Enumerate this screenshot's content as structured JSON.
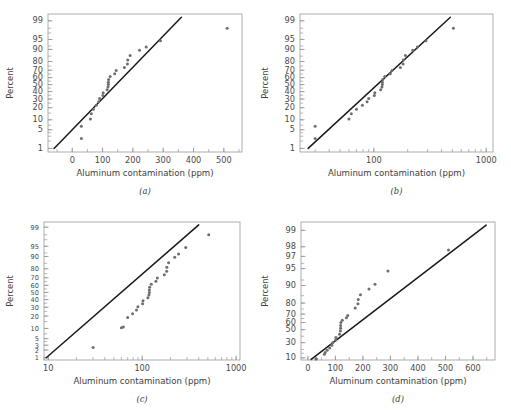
{
  "figure": {
    "background": "#ffffff",
    "point_color": "#6e6e6e",
    "line_color": "#1a1a1a",
    "axis_color": "#9a9a9a",
    "text_color": "#444444"
  },
  "panels": [
    {
      "id": "a",
      "caption": "(a)",
      "xlabel": "Aluminum contamination (ppm)",
      "ylabel": "Percent",
      "xscale": "linear",
      "yscale": "probability",
      "xticks": [
        0,
        100,
        200,
        300,
        400,
        500
      ],
      "xtick_labels": [
        "0",
        "100",
        "200",
        "300",
        "400",
        "500"
      ],
      "yticks": [
        1,
        5,
        10,
        20,
        30,
        40,
        50,
        60,
        70,
        80,
        90,
        95,
        99
      ],
      "ytick_labels": [
        "1",
        "5",
        "10",
        "20",
        "30",
        "40",
        "50",
        "60",
        "70",
        "80",
        "90",
        "95",
        "99"
      ],
      "xlim": [
        -80,
        560
      ],
      "ylim": [
        0.7,
        99.5
      ],
      "line": {
        "x0": -60,
        "y0": 1.0,
        "x1": 360,
        "y1": 99.3
      }
    },
    {
      "id": "b",
      "caption": "(b)",
      "xlabel": "Aluminum contamination (ppm)",
      "ylabel": "Percent",
      "xscale": "log",
      "yscale": "probability",
      "xticks": [
        100,
        1000
      ],
      "xtick_labels": [
        "100",
        "1000"
      ],
      "yticks": [
        1,
        5,
        10,
        20,
        30,
        40,
        50,
        60,
        70,
        80,
        90,
        95,
        99
      ],
      "ytick_labels": [
        "1",
        "5",
        "10",
        "20",
        "30",
        "40",
        "50",
        "60",
        "70",
        "80",
        "90",
        "95",
        "99"
      ],
      "xlim": [
        22,
        1150
      ],
      "ylim": [
        0.7,
        99.5
      ],
      "line": {
        "x0": 26,
        "y0": 1.0,
        "x1": 480,
        "y1": 99.3
      }
    },
    {
      "id": "c",
      "caption": "(c)",
      "xlabel": "Aluminum contamination (ppm)",
      "ylabel": "Percent",
      "xscale": "log",
      "yscale": "lognormal-probability",
      "xticks": [
        10,
        100,
        1000
      ],
      "xtick_labels": [
        "10",
        "100",
        "1000"
      ],
      "yticks": [
        1,
        2,
        3,
        5,
        10,
        20,
        30,
        40,
        50,
        60,
        70,
        80,
        90,
        95,
        99
      ],
      "ytick_labels": [
        "1",
        "2",
        "3",
        "5",
        "10",
        "20",
        "30",
        "40",
        "50",
        "60",
        "70",
        "80",
        "90",
        "95",
        "99"
      ],
      "xlim": [
        9,
        1100
      ],
      "ylim": [
        0.8,
        99.4
      ],
      "line": {
        "x0": 9.5,
        "y0": 1.0,
        "x1": 400,
        "y1": 99.2
      }
    },
    {
      "id": "d",
      "caption": "(d)",
      "xlabel": "Aluminum contamination (ppm)",
      "ylabel": "Percent",
      "xscale": "linear",
      "yscale": "extreme-value-probability",
      "xticks": [
        0,
        100,
        200,
        300,
        400,
        500,
        600
      ],
      "xtick_labels": [
        "0",
        "100",
        "200",
        "300",
        "400",
        "500",
        "600"
      ],
      "yticks": [
        10,
        30,
        50,
        60,
        70,
        80,
        90,
        95,
        97,
        98,
        99
      ],
      "ytick_labels": [
        "10",
        "30",
        "50",
        "60",
        "70",
        "80",
        "90",
        "95",
        "97",
        "98",
        "99"
      ],
      "xlim": [
        -25,
        680
      ],
      "ylim": [
        8,
        99.3
      ],
      "line": {
        "x0": 12,
        "y0": 8.5,
        "x1": 648,
        "y1": 99.2
      }
    }
  ],
  "chart_data": {
    "type": "scatter",
    "title": "",
    "subtitle": "",
    "xlabel": "Aluminum contamination (ppm)",
    "ylabel": "Percent",
    "grid": false,
    "legend": null,
    "aluminum_contamination_ppm": [
      30,
      30,
      60,
      63,
      70,
      79,
      87,
      90,
      101,
      102,
      115,
      118,
      119,
      119,
      120,
      125,
      140,
      145,
      172,
      182,
      183,
      191,
      222,
      244,
      291,
      511
    ],
    "plotting_percent_positions": [
      2.5,
      6.5,
      10.5,
      14.5,
      18.5,
      22.5,
      26.5,
      30.5,
      34.5,
      38.5,
      42.5,
      46.5,
      50.0,
      53.5,
      57.5,
      61.5,
      65.5,
      69.5,
      73.5,
      77.5,
      81.5,
      85.5,
      89.5,
      91.5,
      94.5,
      98.0
    ],
    "series": [
      {
        "name": "(a) normal probability plot",
        "x": [
          30,
          30,
          60,
          63,
          70,
          79,
          87,
          90,
          101,
          102,
          115,
          118,
          119,
          119,
          120,
          125,
          140,
          145,
          172,
          182,
          183,
          191,
          222,
          244,
          291,
          511
        ],
        "y": [
          2.5,
          6.5,
          10.5,
          14.5,
          18.5,
          22.5,
          26.5,
          30.5,
          34.5,
          38.5,
          42.5,
          46.5,
          50.0,
          53.5,
          57.5,
          61.5,
          65.5,
          69.5,
          73.5,
          77.5,
          81.5,
          85.5,
          89.5,
          91.5,
          94.5,
          98.0
        ]
      },
      {
        "name": "(b) log-x normal probability plot",
        "x": [
          30,
          30,
          60,
          63,
          70,
          79,
          87,
          90,
          101,
          102,
          115,
          118,
          119,
          119,
          120,
          125,
          140,
          145,
          172,
          182,
          183,
          191,
          222,
          244,
          291,
          511
        ],
        "y": [
          2.5,
          6.5,
          10.5,
          14.5,
          18.5,
          22.5,
          26.5,
          30.5,
          34.5,
          38.5,
          42.5,
          46.5,
          50.0,
          53.5,
          57.5,
          61.5,
          65.5,
          69.5,
          73.5,
          77.5,
          81.5,
          85.5,
          89.5,
          91.5,
          94.5,
          98.0
        ]
      },
      {
        "name": "(c) lognormal probability plot",
        "x": [
          30,
          60,
          63,
          70,
          79,
          87,
          90,
          101,
          102,
          115,
          118,
          119,
          119,
          120,
          125,
          140,
          145,
          172,
          182,
          183,
          191,
          222,
          244,
          291,
          511
        ],
        "y": [
          2.5,
          10.5,
          11.0,
          18.5,
          22.5,
          26.5,
          30.5,
          34.5,
          38.5,
          42.5,
          46.5,
          50.0,
          53.5,
          57.5,
          61.5,
          65.5,
          69.5,
          73.5,
          77.5,
          81.5,
          85.5,
          89.5,
          91.5,
          94.5,
          98.0
        ]
      },
      {
        "name": "(d) extreme-value probability plot",
        "x": [
          30,
          30,
          60,
          63,
          70,
          79,
          87,
          90,
          101,
          102,
          115,
          118,
          119,
          119,
          120,
          125,
          140,
          145,
          172,
          182,
          183,
          191,
          222,
          244,
          291,
          511
        ],
        "y": [
          9.0,
          9.2,
          14.0,
          16.0,
          19.0,
          22.0,
          26.0,
          30.0,
          34.0,
          38.0,
          43.0,
          48.0,
          52.0,
          56.0,
          60.0,
          63.0,
          66.0,
          68.5,
          76.0,
          79.5,
          82.5,
          85.5,
          88.5,
          90.5,
          94.5,
          97.7
        ]
      }
    ]
  }
}
